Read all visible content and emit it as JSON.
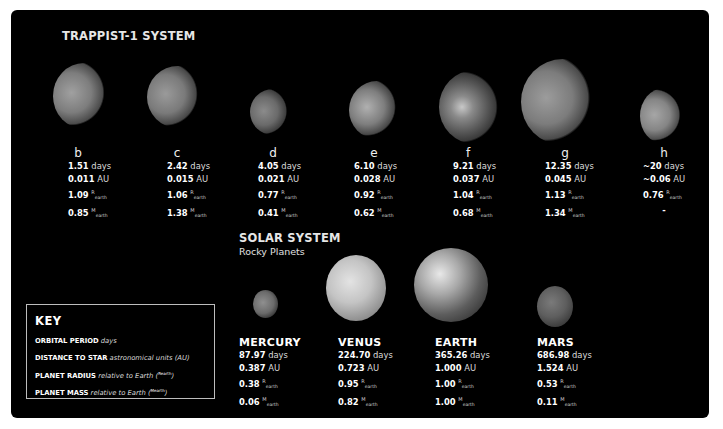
{
  "trappist": {
    "title": "TRAPPIST-1 SYSTEM",
    "planets": [
      {
        "label": "b",
        "period": "1.51",
        "distance": "0.011",
        "radius": "1.09",
        "mass": "0.85"
      },
      {
        "label": "c",
        "period": "2.42",
        "distance": "0.015",
        "radius": "1.06",
        "mass": "1.38"
      },
      {
        "label": "d",
        "period": "4.05",
        "distance": "0.021",
        "radius": "0.77",
        "mass": "0.41"
      },
      {
        "label": "e",
        "period": "6.10",
        "distance": "0.028",
        "radius": "0.92",
        "mass": "0.62"
      },
      {
        "label": "f",
        "period": "9.21",
        "distance": "0.037",
        "radius": "1.04",
        "mass": "0.68"
      },
      {
        "label": "g",
        "period": "12.35",
        "distance": "0.045",
        "radius": "1.13",
        "mass": "1.34"
      },
      {
        "label": "h",
        "period": "~20",
        "distance": "~0.06",
        "radius": "0.76",
        "mass": "-"
      }
    ]
  },
  "solar": {
    "title": "SOLAR SYSTEM",
    "subtitle": "Rocky Planets",
    "planets": [
      {
        "name": "MERCURY",
        "period": "87.97",
        "distance": "0.387",
        "radius": "0.38",
        "mass": "0.06"
      },
      {
        "name": "VENUS",
        "period": "224.70",
        "distance": "0.723",
        "radius": "0.95",
        "mass": "0.82"
      },
      {
        "name": "EARTH",
        "period": "365.26",
        "distance": "1.000",
        "radius": "1.00",
        "mass": "1.00"
      },
      {
        "name": "MARS",
        "period": "686.98",
        "distance": "1.524",
        "radius": "0.53",
        "mass": "0.11"
      }
    ]
  },
  "units": {
    "days": "days",
    "au": "AU",
    "r_sym": "R",
    "m_sym": "M",
    "earth_sub": "earth"
  },
  "key": {
    "title": "KEY",
    "rows": [
      {
        "term": "ORBITAL PERIOD",
        "desc": "days",
        "sym": ""
      },
      {
        "term": "DISTANCE TO STAR",
        "desc": "astronomical units (AU)",
        "sym": ""
      },
      {
        "term": "PLANET RADIUS",
        "desc": "relative to Earth (",
        "sym": "Rearth",
        "close": ")"
      },
      {
        "term": "PLANET MASS",
        "desc": "relative to Earth (",
        "sym": "Mearth",
        "close": ")"
      }
    ]
  },
  "colors": {
    "background": "#000000",
    "frame": "#ffffff",
    "text": "#ffffff",
    "key_border": "#bdbdbd"
  }
}
